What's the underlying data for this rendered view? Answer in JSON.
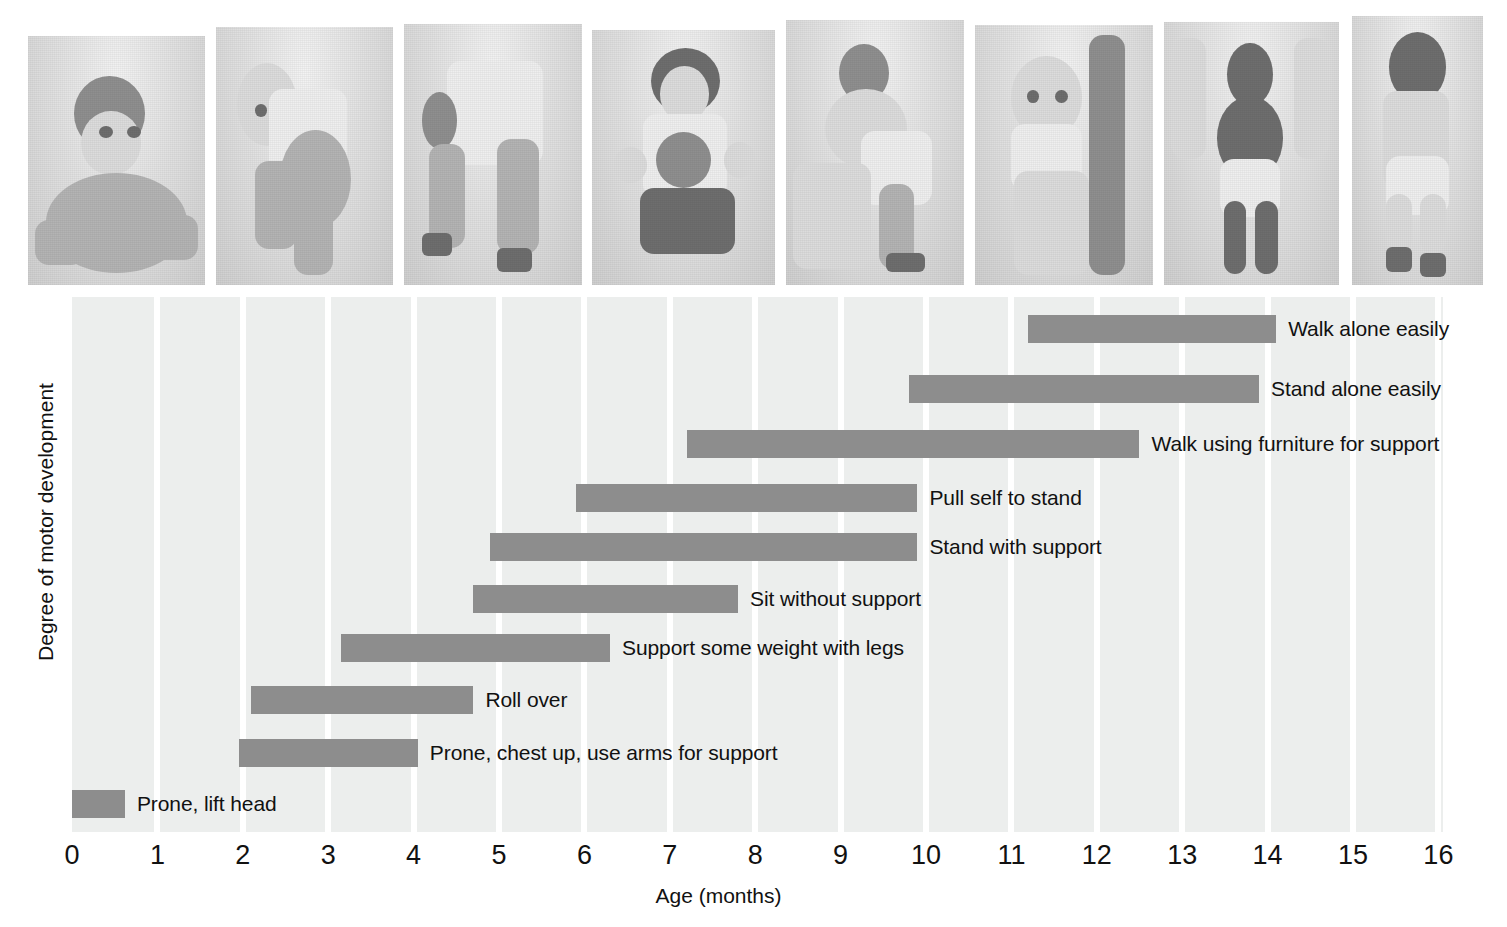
{
  "figure": {
    "y_axis_label": "Degree of motor development",
    "x_axis_label": "Age (months)"
  },
  "photos": [
    {
      "name": "photo-prone-lift-head",
      "alt": "Infant lying prone lifting head and chest, smiling"
    },
    {
      "name": "photo-rolling-over",
      "alt": "Infant rolling over on a blanket"
    },
    {
      "name": "photo-supporting-weight",
      "alt": "Infant on hands and feet supporting weight with legs"
    },
    {
      "name": "photo-sitting-without-support",
      "alt": "Infant sitting unsupported on the floor"
    },
    {
      "name": "photo-pull-self-to-stand",
      "alt": "Infant pulling self up to stand on a low bench"
    },
    {
      "name": "photo-stand-with-support",
      "alt": "Infant standing while holding onto furniture, smiling"
    },
    {
      "name": "photo-walk-with-help",
      "alt": "Toddler walking while held by an adult's hands"
    },
    {
      "name": "photo-walk-alone",
      "alt": "Toddler walking alone"
    }
  ],
  "chart_data": {
    "type": "bar",
    "subtype": "horizontal-range-gantt",
    "title": "",
    "xlabel": "Age (months)",
    "ylabel": "Degree of motor development",
    "xlim": [
      0,
      16
    ],
    "xticks": [
      "0",
      "1",
      "2",
      "3",
      "4",
      "5",
      "6",
      "7",
      "8",
      "9",
      "10",
      "11",
      "12",
      "13",
      "14",
      "15",
      "16"
    ],
    "grid": "vertical",
    "legend": "none",
    "bar_color": "#8d8d8d",
    "plot_background": "#eceeed",
    "milestones": [
      {
        "label": "Walk alone easily",
        "start": 11.2,
        "end": 14.1
      },
      {
        "label": "Stand alone easily",
        "start": 9.8,
        "end": 13.9
      },
      {
        "label": "Walk using furniture for support",
        "start": 7.2,
        "end": 12.5
      },
      {
        "label": "Pull self to stand",
        "start": 5.9,
        "end": 9.9
      },
      {
        "label": "Stand with support",
        "start": 4.9,
        "end": 9.9
      },
      {
        "label": "Sit without support",
        "start": 4.7,
        "end": 7.8
      },
      {
        "label": "Support some weight with legs",
        "start": 3.15,
        "end": 6.3
      },
      {
        "label": "Roll over",
        "start": 2.1,
        "end": 4.7
      },
      {
        "label": "Prone, chest up, use arms for support",
        "start": 1.95,
        "end": 4.05
      },
      {
        "label": "Prone, lift head",
        "start": 0.0,
        "end": 0.62
      }
    ]
  }
}
